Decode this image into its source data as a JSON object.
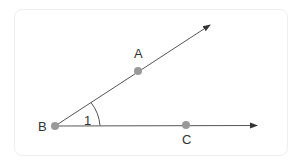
{
  "diagram": {
    "points": [
      {
        "id": "A",
        "label": "A",
        "x": 138,
        "y": 71
      },
      {
        "id": "B",
        "label": "B",
        "x": 55,
        "y": 126
      },
      {
        "id": "C",
        "label": "C",
        "x": 186,
        "y": 125
      }
    ],
    "rays": [
      {
        "from": "B",
        "through": "A",
        "label": "ray-BA"
      },
      {
        "from": "B",
        "through": "C",
        "label": "ray-BC"
      }
    ],
    "angle_label": "1",
    "colors": {
      "line": "#444444",
      "point": "#999999",
      "text": "#333333",
      "frame": "#efefef"
    }
  }
}
